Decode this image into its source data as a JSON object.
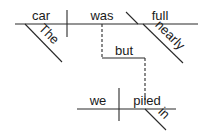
{
  "diagram": {
    "type": "sentence-diagram",
    "main_clause": {
      "subject": "car",
      "subject_modifier": "The",
      "verb": "was",
      "predicate_adjective": "full",
      "predicate_modifier": "nearly"
    },
    "conjunction": "but",
    "second_clause": {
      "subject": "we",
      "verb": "piled",
      "verb_modifier": "in"
    },
    "colors": {
      "line": "#2a2a2a",
      "text": "#1a1a1a",
      "background": "#ffffff"
    }
  }
}
